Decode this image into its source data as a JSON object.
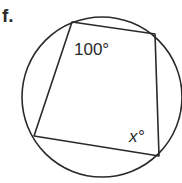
{
  "problem": {
    "label": "f."
  },
  "diagram": {
    "type": "cyclic-quadrilateral",
    "circle": {
      "cx": 102,
      "cy": 97,
      "r": 80
    },
    "vertices": [
      {
        "name": "top-left",
        "x": 72,
        "y": 22
      },
      {
        "name": "top-right",
        "x": 155,
        "y": 34
      },
      {
        "name": "bottom-right",
        "x": 159,
        "y": 156
      },
      {
        "name": "bottom-left",
        "x": 34,
        "y": 136
      }
    ],
    "angles": [
      {
        "vertex": "top-left",
        "label": "100°"
      },
      {
        "vertex": "bottom-right",
        "label": "x°"
      }
    ],
    "stroke_color": "#2a2a2a"
  }
}
